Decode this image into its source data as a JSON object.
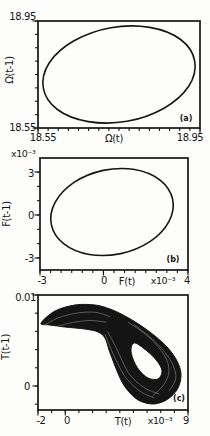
{
  "figure": {
    "panels": [
      {
        "panel_label": "(a)",
        "x_title": "Ω(t)",
        "y_title": "Ω(t-1)",
        "x_tick_labels": [
          "18.55",
          "18.95"
        ],
        "y_tick_labels": [
          "18.95",
          "18.55"
        ]
      },
      {
        "panel_label": "(b)",
        "x_title": "F(t)",
        "y_title": "F(t-1)",
        "x_scale_label": "x10⁻³",
        "y_scale_label": "x10⁻³",
        "x_tick_labels": [
          "-3",
          "0",
          "4"
        ],
        "y_tick_labels": [
          "3",
          "0",
          "-3"
        ]
      },
      {
        "panel_label": "(c)",
        "x_title": "T(t)",
        "y_title": "T(t-1)",
        "x_scale_label": "x10⁻³",
        "x_tick_labels": [
          "-2",
          "0",
          "9"
        ],
        "y_tick_labels": [
          "0.01",
          "0"
        ]
      }
    ]
  },
  "chart_data": [
    {
      "id": "a",
      "type": "line",
      "curve_style": "closed-loop",
      "xlabel": "Ω(t)",
      "ylabel": "Ω(t-1)",
      "xlim": [
        18.55,
        18.95
      ],
      "ylim": [
        18.55,
        18.95
      ],
      "x_ticks": {
        "major": [
          18.55,
          18.95
        ],
        "minor_step": 0.025
      },
      "y_ticks": {
        "major": [
          18.55,
          18.95
        ],
        "minor_step": 0.05
      },
      "loop_points": [
        [
          18.937,
          18.8
        ],
        [
          18.922,
          18.706
        ],
        [
          18.861,
          18.624
        ],
        [
          18.77,
          18.575
        ],
        [
          18.674,
          18.574
        ],
        [
          18.598,
          18.619
        ],
        [
          18.563,
          18.7
        ],
        [
          18.578,
          18.794
        ],
        [
          18.639,
          18.876
        ],
        [
          18.73,
          18.925
        ],
        [
          18.826,
          18.926
        ],
        [
          18.902,
          18.881
        ]
      ],
      "description": "Return map Ω(t-1) vs Ω(t): single closed limit-cycle loop"
    },
    {
      "id": "b",
      "type": "line",
      "curve_style": "closed-loop",
      "xlabel": "F(t)",
      "ylabel": "F(t-1)",
      "units": "1e-3",
      "xlim": [
        -3,
        4
      ],
      "ylim": [
        -3.84,
        3.98
      ],
      "x_ticks": {
        "major": [
          -3,
          0,
          4
        ],
        "minor_step": 0.5
      },
      "y_ticks": {
        "major": [
          -3,
          0,
          3
        ],
        "minor_step": 1
      },
      "loop_points": [
        [
          3.272,
          1.109
        ],
        [
          3.097,
          -0.461
        ],
        [
          2.198,
          -1.857
        ],
        [
          0.821,
          -2.694
        ],
        [
          -0.668,
          -2.757
        ],
        [
          -1.87,
          -2.017
        ],
        [
          -2.461,
          -0.692
        ],
        [
          -2.286,
          0.878
        ],
        [
          -1.392,
          2.274
        ],
        [
          -0.011,
          3.112
        ],
        [
          1.479,
          3.175
        ],
        [
          2.68,
          2.435
        ]
      ],
      "description": "Return map F(t-1) vs F(t): single closed limit-cycle loop (values x10^-3)"
    },
    {
      "id": "c",
      "type": "area",
      "curve_style": "chaotic-band",
      "xlabel": "T(t)",
      "ylabel": "T(t-1)",
      "units": "1e-3",
      "xlim": [
        -2,
        9
      ],
      "ylim": [
        -2.64,
        10.0
      ],
      "x_ticks": {
        "major": [
          -2,
          0,
          9
        ],
        "minor_step": 1
      },
      "y_ticks": {
        "major": [
          0,
          10
        ],
        "minor_step": 2
      },
      "band_outer": [
        [
          -1.78,
          6.9
        ],
        [
          -0.75,
          8.24
        ],
        [
          0.71,
          8.9
        ],
        [
          2.18,
          8.9
        ],
        [
          3.28,
          8.46
        ],
        [
          4.38,
          7.69
        ],
        [
          5.48,
          6.7
        ],
        [
          6.58,
          5.49
        ],
        [
          7.53,
          4.18
        ],
        [
          8.19,
          2.75
        ],
        [
          8.49,
          1.32
        ],
        [
          8.27,
          -0.22
        ],
        [
          7.53,
          -1.43
        ],
        [
          6.51,
          -1.98
        ],
        [
          5.48,
          -1.65
        ],
        [
          4.75,
          -0.77
        ],
        [
          4.16,
          0.44
        ],
        [
          3.65,
          2.2
        ],
        [
          3.21,
          3.96
        ],
        [
          2.91,
          5.27
        ],
        [
          2.4,
          5.93
        ],
        [
          1.45,
          6.26
        ],
        [
          -0.02,
          6.48
        ],
        [
          -1.12,
          6.7
        ]
      ],
      "band_hole": [
        [
          5.11,
          4.73
        ],
        [
          5.99,
          3.85
        ],
        [
          6.73,
          2.75
        ],
        [
          7.09,
          1.65
        ],
        [
          6.8,
          0.77
        ],
        [
          6.07,
          0.88
        ],
        [
          5.41,
          1.76
        ],
        [
          4.97,
          2.97
        ],
        [
          4.82,
          4.07
        ]
      ],
      "texture_lines": [
        [
          [
            -1.5,
            6.7
          ],
          [
            -0.5,
            7.5
          ],
          [
            0.8,
            8.0
          ],
          [
            2.2,
            8.1
          ],
          [
            3.3,
            7.6
          ]
        ],
        [
          [
            -1.2,
            6.3
          ],
          [
            0.3,
            6.9
          ],
          [
            1.8,
            7.2
          ],
          [
            3.0,
            7.0
          ]
        ],
        [
          [
            2.9,
            5.7
          ],
          [
            3.4,
            3.9
          ],
          [
            3.9,
            2.3
          ],
          [
            4.5,
            0.8
          ],
          [
            5.5,
            -0.6
          ],
          [
            6.5,
            -1.3
          ]
        ],
        [
          [
            3.1,
            6.0
          ],
          [
            3.7,
            4.3
          ],
          [
            4.2,
            2.7
          ],
          [
            4.75,
            1.2
          ],
          [
            5.8,
            -0.2
          ],
          [
            6.9,
            -0.9
          ]
        ],
        [
          [
            5.0,
            6.8
          ],
          [
            6.2,
            5.4
          ],
          [
            7.2,
            3.9
          ],
          [
            7.9,
            2.3
          ],
          [
            8.1,
            0.8
          ],
          [
            7.6,
            -0.6
          ]
        ],
        [
          [
            4.6,
            7.0
          ],
          [
            5.7,
            5.9
          ],
          [
            6.7,
            4.5
          ],
          [
            7.4,
            3.0
          ],
          [
            7.6,
            1.5
          ],
          [
            7.2,
            0.1
          ],
          [
            6.4,
            -1.1
          ]
        ]
      ],
      "description": "Return map T(t-1) vs T(t): dense chaotic attractor band folded into a loop with central hole (values x10^-3)"
    }
  ]
}
